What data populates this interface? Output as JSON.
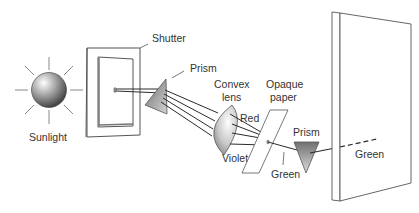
{
  "diagram": {
    "labels": {
      "sunlight": "Sunlight",
      "shutter": "Shutter",
      "prism1": "Prism",
      "convex_lens_line1": "Convex",
      "convex_lens_line2": "lens",
      "red": "Red",
      "violet": "Violet",
      "opaque_paper_line1": "Opaque",
      "opaque_paper_line2": "paper",
      "green_slit": "Green",
      "prism2": "Prism",
      "green_screen": "Green"
    },
    "colors": {
      "line": "#2a2a2a",
      "outline": "#555555",
      "text": "#333333",
      "background": "#ffffff"
    }
  }
}
